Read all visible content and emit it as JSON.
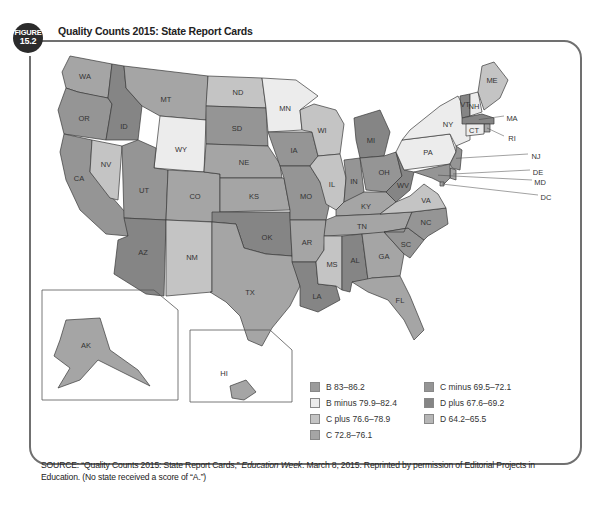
{
  "figure": {
    "badge_top": "FIGURE",
    "badge_number": "15.2",
    "title": "Quality Counts 2015: State Report Cards"
  },
  "grade_colors": {
    "B": "#9b9b9b",
    "B minus": "#ececec",
    "C plus": "#c4c4c4",
    "C": "#a5a5a5",
    "C minus": "#959595",
    "D plus": "#858585",
    "D": "#b6b6b6"
  },
  "legend": {
    "items": [
      {
        "grade": "B",
        "label": "B 83–86.2"
      },
      {
        "grade": "B minus",
        "label": "B minus 79.9–82.4"
      },
      {
        "grade": "C plus",
        "label": "C plus 76.6–78.9"
      },
      {
        "grade": "C",
        "label": "C 72.8–76.1"
      },
      {
        "grade": "C minus",
        "label": "C minus 69.5–72.1"
      },
      {
        "grade": "D plus",
        "label": "D plus 67.6–69.2"
      },
      {
        "grade": "D",
        "label": "D 64.2–65.5"
      }
    ]
  },
  "states": [
    {
      "abbr": "WA",
      "grade": "C"
    },
    {
      "abbr": "OR",
      "grade": "C minus"
    },
    {
      "abbr": "CA",
      "grade": "C minus"
    },
    {
      "abbr": "ID",
      "grade": "D plus"
    },
    {
      "abbr": "NV",
      "grade": "C plus"
    },
    {
      "abbr": "MT",
      "grade": "C"
    },
    {
      "abbr": "WY",
      "grade": "B minus"
    },
    {
      "abbr": "UT",
      "grade": "C minus"
    },
    {
      "abbr": "AZ",
      "grade": "D plus"
    },
    {
      "abbr": "CO",
      "grade": "C"
    },
    {
      "abbr": "NM",
      "grade": "C plus"
    },
    {
      "abbr": "ND",
      "grade": "C plus"
    },
    {
      "abbr": "SD",
      "grade": "C minus"
    },
    {
      "abbr": "NE",
      "grade": "C"
    },
    {
      "abbr": "KS",
      "grade": "C"
    },
    {
      "abbr": "OK",
      "grade": "D plus"
    },
    {
      "abbr": "TX",
      "grade": "C"
    },
    {
      "abbr": "MN",
      "grade": "B minus"
    },
    {
      "abbr": "IA",
      "grade": "C minus"
    },
    {
      "abbr": "MO",
      "grade": "C minus"
    },
    {
      "abbr": "AR",
      "grade": "C"
    },
    {
      "abbr": "LA",
      "grade": "D plus"
    },
    {
      "abbr": "WI",
      "grade": "C plus"
    },
    {
      "abbr": "IL",
      "grade": "C plus"
    },
    {
      "abbr": "MI",
      "grade": "D plus"
    },
    {
      "abbr": "IN",
      "grade": "C minus"
    },
    {
      "abbr": "OH",
      "grade": "C minus"
    },
    {
      "abbr": "KY",
      "grade": "C"
    },
    {
      "abbr": "TN",
      "grade": "C"
    },
    {
      "abbr": "MS",
      "grade": "C plus"
    },
    {
      "abbr": "AL",
      "grade": "D plus"
    },
    {
      "abbr": "GA",
      "grade": "C"
    },
    {
      "abbr": "FL",
      "grade": "C"
    },
    {
      "abbr": "SC",
      "grade": "C minus"
    },
    {
      "abbr": "NC",
      "grade": "C minus"
    },
    {
      "abbr": "VA",
      "grade": "C plus"
    },
    {
      "abbr": "WV",
      "grade": "D plus"
    },
    {
      "abbr": "PA",
      "grade": "B minus"
    },
    {
      "abbr": "NY",
      "grade": "B minus"
    },
    {
      "abbr": "VT",
      "grade": "D plus"
    },
    {
      "abbr": "NH",
      "grade": "B minus"
    },
    {
      "abbr": "ME",
      "grade": "C plus"
    },
    {
      "abbr": "MA",
      "grade": "D plus"
    },
    {
      "abbr": "RI",
      "grade": "C"
    },
    {
      "abbr": "CT",
      "grade": "B minus"
    },
    {
      "abbr": "NJ",
      "grade": "C minus"
    },
    {
      "abbr": "DE",
      "grade": "C"
    },
    {
      "abbr": "MD",
      "grade": "C minus"
    },
    {
      "abbr": "DC",
      "grade": "C"
    },
    {
      "abbr": "AK",
      "grade": "C"
    },
    {
      "abbr": "HI",
      "grade": "C"
    }
  ],
  "source": {
    "prefix": "SOURCE: “Quality Counts 2015: State Report Cards,” ",
    "publication": "Education Week",
    "suffix": ". March 8, 2015. Reprinted by permission of Editorial Projects in Education. (No state received a score of “A.”)"
  }
}
